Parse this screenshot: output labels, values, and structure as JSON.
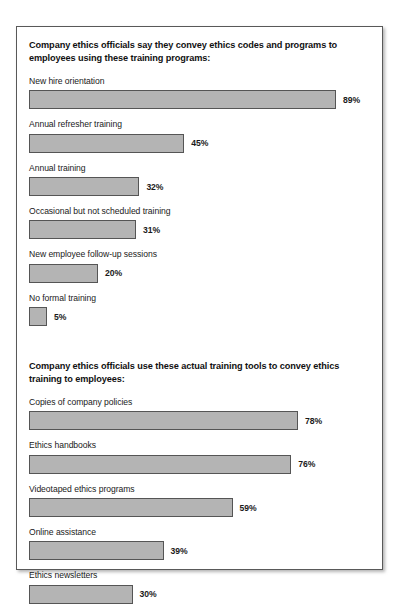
{
  "chart_data": {
    "type": "bar",
    "orientation": "horizontal",
    "title": "",
    "xlabel": "",
    "ylabel": "",
    "xlim": [
      0,
      100
    ],
    "grid": false,
    "legend": null,
    "value_suffix": "%",
    "sections": [
      {
        "heading": "Company ethics officials say they convey ethics codes and programs to employees using these training programs:",
        "categories": [
          "New hire orientation",
          "Annual refresher training",
          "Annual training",
          "Occasional but not scheduled training",
          "New employee follow-up sessions",
          "No formal training"
        ],
        "values": [
          89,
          45,
          32,
          31,
          20,
          5
        ],
        "value_labels": [
          "89%",
          "45%",
          "32%",
          "31%",
          "20%",
          "5%"
        ]
      },
      {
        "heading": "Company ethics officials use these actual training tools to convey ethics training to employees:",
        "categories": [
          "Copies of company policies",
          "Ethics handbooks",
          "Videotaped ethics programs",
          "Online assistance",
          "Ethics newsletters"
        ],
        "values": [
          78,
          76,
          59,
          39,
          30
        ],
        "value_labels": [
          "78%",
          "76%",
          "59%",
          "39%",
          "30%"
        ]
      }
    ]
  },
  "style": {
    "bar_fill": "#b4b4b4",
    "bar_border": "#555555",
    "panel_border": "#595959",
    "text_color": "#1a1a1a",
    "background": "#ffffff"
  }
}
